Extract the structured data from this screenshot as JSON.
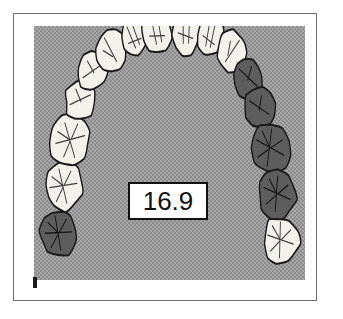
{
  "figure": {
    "name": "dental-arch-diagram",
    "background_color": "#a8a8a8",
    "frame_color": "#6e6e6e",
    "panel_label": "halftone-gray-panel"
  },
  "measurement": {
    "value": "16.9",
    "box_border_color": "#111111",
    "box_fill_color": "#ffffff"
  },
  "legend": {
    "light_tooth_color": "#f2f1ec",
    "dark_tooth_color": "#5d5d5d",
    "outline_color": "#1a1a1a"
  },
  "arch": {
    "description": "maxillary dental arch, occlusal view",
    "teeth": [
      {
        "id": "left-third-molar",
        "shade": "dark",
        "cx": 35,
        "cy": 207,
        "rx": 26,
        "ry": 24,
        "rot": -8,
        "pattern": "molar"
      },
      {
        "id": "left-second-molar",
        "shade": "light",
        "cx": 42,
        "cy": 160,
        "rx": 27,
        "ry": 24,
        "rot": -12,
        "pattern": "molar"
      },
      {
        "id": "left-first-molar",
        "shade": "light",
        "cx": 52,
        "cy": 114,
        "rx": 29,
        "ry": 25,
        "rot": -16,
        "pattern": "molar"
      },
      {
        "id": "left-second-premolar",
        "shade": "light",
        "cx": 66,
        "cy": 74,
        "rx": 22,
        "ry": 20,
        "rot": -22,
        "pattern": "premolar"
      },
      {
        "id": "left-first-premolar",
        "shade": "light",
        "cx": 84,
        "cy": 45,
        "rx": 22,
        "ry": 20,
        "rot": -30,
        "pattern": "premolar"
      },
      {
        "id": "left-canine",
        "shade": "light",
        "cx": 110,
        "cy": 24,
        "rx": 21,
        "ry": 22,
        "rot": -40,
        "pattern": "canine"
      },
      {
        "id": "left-lateral-incisor",
        "shade": "light",
        "cx": 143,
        "cy": 10,
        "rx": 18,
        "ry": 21,
        "rot": -22,
        "pattern": "incisor"
      },
      {
        "id": "left-central-incisor",
        "shade": "light",
        "cx": 176,
        "cy": 4,
        "rx": 21,
        "ry": 25,
        "rot": -8,
        "pattern": "incisor"
      },
      {
        "id": "right-central-incisor",
        "shade": "light",
        "cx": 218,
        "cy": 4,
        "rx": 21,
        "ry": 25,
        "rot": 8,
        "pattern": "incisor"
      },
      {
        "id": "right-lateral-incisor",
        "shade": "light",
        "cx": 252,
        "cy": 10,
        "rx": 18,
        "ry": 21,
        "rot": 22,
        "pattern": "incisor"
      },
      {
        "id": "right-canine",
        "shade": "light",
        "cx": 283,
        "cy": 26,
        "rx": 21,
        "ry": 22,
        "rot": 40,
        "pattern": "canine"
      },
      {
        "id": "right-first-premolar",
        "shade": "dark",
        "cx": 306,
        "cy": 52,
        "rx": 22,
        "ry": 20,
        "rot": 30,
        "pattern": "premolar"
      },
      {
        "id": "right-second-premolar",
        "shade": "dark",
        "cx": 322,
        "cy": 82,
        "rx": 22,
        "ry": 20,
        "rot": 22,
        "pattern": "premolar"
      },
      {
        "id": "right-first-molar",
        "shade": "dark",
        "cx": 337,
        "cy": 122,
        "rx": 29,
        "ry": 25,
        "rot": 16,
        "pattern": "molar"
      },
      {
        "id": "right-second-molar",
        "shade": "dark",
        "cx": 347,
        "cy": 168,
        "rx": 27,
        "ry": 24,
        "rot": 12,
        "pattern": "molar"
      },
      {
        "id": "right-third-molar",
        "shade": "light",
        "cx": 352,
        "cy": 214,
        "rx": 26,
        "ry": 24,
        "rot": 8,
        "pattern": "molar"
      }
    ]
  }
}
